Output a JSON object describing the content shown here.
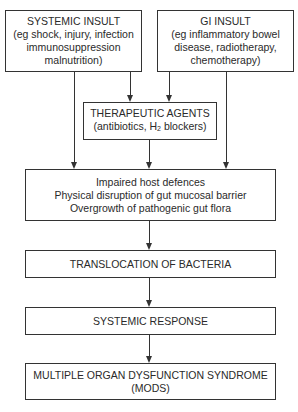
{
  "diagram": {
    "systemic_insult": {
      "title": "SYSTEMIC INSULT",
      "line1": "(eg shock, injury, infection",
      "line2": "immunosuppression",
      "line3": "malnutrition)"
    },
    "gi_insult": {
      "title": "GI INSULT",
      "line1": "(eg inflammatory bowel",
      "line2": "disease, radiotherapy,",
      "line3": "chemotherapy)"
    },
    "therapeutic_agents": {
      "title": "THERAPEUTIC AGENTS",
      "line1_prefix": "(antibiotics, H",
      "line1_sub": "2",
      "line1_suffix": " blockers)"
    },
    "mechanisms": {
      "line1": "Impaired host defences",
      "line2": "Physical disruption of gut mucosal barrier",
      "line3": "Overgrowth of pathogenic gut flora"
    },
    "translocation": {
      "title": "TRANSLOCATION OF BACTERIA"
    },
    "systemic_response": {
      "title": "SYSTEMIC RESPONSE"
    },
    "mods": {
      "title": "MULTIPLE ORGAN DYSFUNCTION SYNDROME",
      "abbrev": "(MODS)"
    },
    "edges": [
      {
        "from": "systemic_insult",
        "to": "mechanisms"
      },
      {
        "from": "systemic_insult",
        "to": "therapeutic_agents"
      },
      {
        "from": "gi_insult",
        "to": "therapeutic_agents"
      },
      {
        "from": "gi_insult",
        "to": "mechanisms"
      },
      {
        "from": "therapeutic_agents",
        "to": "mechanisms"
      },
      {
        "from": "mechanisms",
        "to": "translocation"
      },
      {
        "from": "translocation",
        "to": "systemic_response"
      },
      {
        "from": "systemic_response",
        "to": "mods"
      }
    ]
  }
}
